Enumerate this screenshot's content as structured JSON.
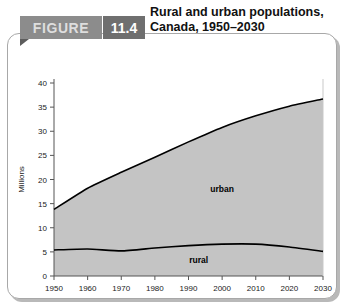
{
  "figure": {
    "badge_label": "FIGURE",
    "number": "11.4",
    "title_line1": "Rural and urban populations,",
    "title_line2": "Canada, 1950–2030"
  },
  "colors": {
    "badge_bg": "#8c8c8c",
    "badge_text": "#dedede",
    "number_bg": "#6f6f6f",
    "number_text": "#ffffff",
    "area_fill": "#c4c4c4",
    "line": "#000000",
    "panel_border": "#a8a8a8",
    "axis": "#555555"
  },
  "chart_data": {
    "type": "area",
    "title": "Rural and urban populations, Canada, 1950–2030",
    "subtitle": "",
    "xlabel": "",
    "ylabel": "Millions",
    "x": [
      1950,
      1960,
      1970,
      1980,
      1990,
      2000,
      2010,
      2020,
      2030
    ],
    "xtick_labels": [
      "1950",
      "1960",
      "1970",
      "1980",
      "1990",
      "2000",
      "2010",
      "2020",
      "2030"
    ],
    "xlim": [
      1950,
      2030
    ],
    "ytick_labels": [
      "0",
      "5",
      "10",
      "15",
      "20",
      "25",
      "30",
      "35",
      "40"
    ],
    "yticks": [
      0,
      5,
      10,
      15,
      20,
      25,
      30,
      35,
      40
    ],
    "ylim": [
      0,
      40
    ],
    "grid": false,
    "legend": "in-plot annotations",
    "stacked": true,
    "series": [
      {
        "name": "rural",
        "label": "rural",
        "values": [
          5.4,
          5.6,
          5.2,
          5.8,
          6.3,
          6.6,
          6.6,
          6.0,
          5.1
        ]
      },
      {
        "name": "urban",
        "label": "urban",
        "values": [
          8.4,
          12.6,
          16.3,
          18.8,
          21.5,
          24.2,
          26.6,
          29.2,
          31.6
        ]
      }
    ],
    "total_values": [
      13.8,
      18.2,
      21.5,
      24.6,
      27.8,
      30.8,
      33.2,
      35.2,
      36.7
    ],
    "annotations": [
      {
        "text": "urban",
        "x": 2000,
        "y": 17.5
      },
      {
        "text": "rural",
        "x": 1993,
        "y": 2.6
      }
    ]
  }
}
